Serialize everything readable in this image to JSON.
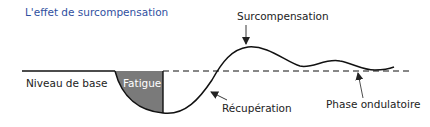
{
  "title": "L'effet de surcompensation",
  "labels": {
    "baseline": "Niveau de base",
    "fatigue": "Fatigue",
    "supercompensation": "Surcompensation",
    "recovery": "Récupération",
    "wave_phase": "Phase ondulatoire"
  },
  "colors": {
    "title": "#2f4fa0",
    "fatigue_fill": "#7a7a7a",
    "curve": "#111111",
    "text": "#222222"
  }
}
